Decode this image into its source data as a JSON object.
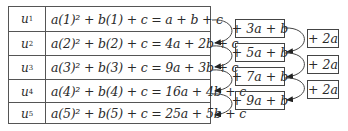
{
  "table": {
    "rows": [
      {
        "term": "u",
        "index": "1",
        "expression": "a(1)² + b(1) + c = a + b + c"
      },
      {
        "term": "u",
        "index": "2",
        "expression": "a(2)² + b(2) + c = 4a + 2b + c"
      },
      {
        "term": "u",
        "index": "3",
        "expression": "a(3)² + b(3) + c = 9a + 3b + c"
      },
      {
        "term": "u",
        "index": "4",
        "expression": "a(4)² + b(4) + c = 16a + 4b + c"
      },
      {
        "term": "u",
        "index": "5",
        "expression": "a(5)² + b(5) + c = 25a + 5b + c"
      }
    ]
  },
  "first_differences": [
    "+ 3a + b",
    "+ 5a + b",
    "+ 7a + b",
    "+ 9a + b"
  ],
  "second_differences": [
    "+ 2a",
    "+ 2a",
    "+ 2a"
  ]
}
